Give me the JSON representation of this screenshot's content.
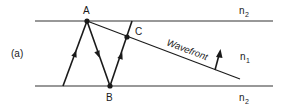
{
  "figure": {
    "panel_label": "(a)",
    "points": {
      "A": "A",
      "B": "B",
      "C": "C"
    },
    "wavefront_label": "Wavefront",
    "media": {
      "top": "n",
      "top_sub": "2",
      "core": "n",
      "core_sub": "1",
      "bottom": "n",
      "bottom_sub": "2"
    },
    "colors": {
      "stroke": "#1a1a1a",
      "background": "#ffffff"
    }
  }
}
